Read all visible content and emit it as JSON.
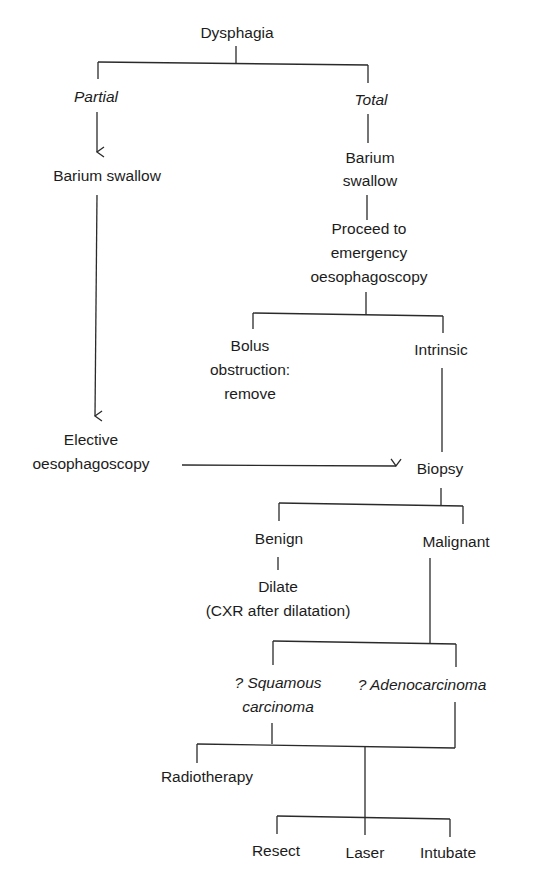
{
  "diagram": {
    "header_cropped_text": "Dysphagia",
    "nodes": {
      "dysphagia": {
        "lines": [
          "Dysphagia"
        ],
        "italic": false
      },
      "partial": {
        "lines": [
          "Partial"
        ],
        "italic": true
      },
      "total": {
        "lines": [
          "Total"
        ],
        "italic": true
      },
      "barium_left": {
        "lines": [
          "Barium swallow"
        ],
        "italic": false
      },
      "barium_right": {
        "lines": [
          "Barium",
          "swallow"
        ],
        "italic": false
      },
      "emergency": {
        "lines": [
          "Proceed to",
          "emergency",
          "oesophagoscopy"
        ],
        "italic": false
      },
      "bolus": {
        "lines": [
          "Bolus",
          "obstruction:",
          "remove"
        ],
        "italic": false
      },
      "intrinsic": {
        "lines": [
          "Intrinsic"
        ],
        "italic": false
      },
      "elective": {
        "lines": [
          "Elective",
          "oesophagoscopy"
        ],
        "italic": false
      },
      "biopsy": {
        "lines": [
          "Biopsy"
        ],
        "italic": false
      },
      "benign": {
        "lines": [
          "Benign"
        ],
        "italic": false
      },
      "malignant": {
        "lines": [
          "Malignant"
        ],
        "italic": false
      },
      "dilate": {
        "lines": [
          "Dilate",
          "(CXR after dilatation)"
        ],
        "italic": false
      },
      "squamous": {
        "lines": [
          "? Squamous",
          "carcinoma"
        ],
        "italic": true
      },
      "adeno": {
        "lines": [
          "? Adenocarcinoma"
        ],
        "italic": true
      },
      "radiotherapy": {
        "lines": [
          "Radiotherapy"
        ],
        "italic": false
      },
      "resect": {
        "lines": [
          "Resect"
        ],
        "italic": false
      },
      "laser": {
        "lines": [
          "Laser"
        ],
        "italic": false
      },
      "intubate": {
        "lines": [
          "Intubate"
        ],
        "italic": false
      }
    },
    "edges": [
      {
        "from": "Dysphagia",
        "to": "Partial",
        "type": "line"
      },
      {
        "from": "Dysphagia",
        "to": "Total",
        "type": "line"
      },
      {
        "from": "Partial",
        "to": "Barium swallow",
        "type": "arrow"
      },
      {
        "from": "Total",
        "to": "Barium swallow",
        "type": "line"
      },
      {
        "from": "Barium swallow (left)",
        "to": "Elective oesophagoscopy",
        "type": "arrow"
      },
      {
        "from": "Barium swallow (right)",
        "to": "Proceed to emergency oesophagoscopy",
        "type": "line"
      },
      {
        "from": "Proceed to emergency oesophagoscopy",
        "to": "Bolus obstruction: remove",
        "type": "line"
      },
      {
        "from": "Proceed to emergency oesophagoscopy",
        "to": "Intrinsic",
        "type": "line"
      },
      {
        "from": "Intrinsic",
        "to": "Biopsy",
        "type": "line"
      },
      {
        "from": "Elective oesophagoscopy",
        "to": "Biopsy",
        "type": "arrow"
      },
      {
        "from": "Biopsy",
        "to": "Benign",
        "type": "line"
      },
      {
        "from": "Biopsy",
        "to": "Malignant",
        "type": "line"
      },
      {
        "from": "Benign",
        "to": "Dilate (CXR after dilatation)",
        "type": "line"
      },
      {
        "from": "Malignant",
        "to": "? Squamous carcinoma",
        "type": "line"
      },
      {
        "from": "Malignant",
        "to": "? Adenocarcinoma",
        "type": "line"
      },
      {
        "from": "? Squamous carcinoma",
        "to": "Radiotherapy",
        "type": "line"
      },
      {
        "from": "? Squamous carcinoma / ? Adenocarcinoma",
        "to": "Resect",
        "type": "line"
      },
      {
        "from": "? Squamous carcinoma / ? Adenocarcinoma",
        "to": "Laser",
        "type": "line"
      },
      {
        "from": "? Squamous carcinoma / ? Adenocarcinoma",
        "to": "Intubate",
        "type": "line"
      }
    ],
    "colors": {
      "background": "#ffffff",
      "ink": "#1c1c1c"
    }
  }
}
